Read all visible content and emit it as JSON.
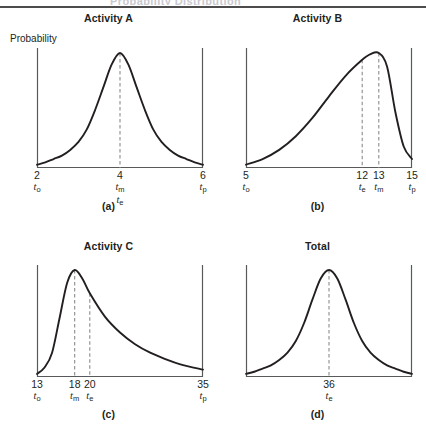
{
  "figure": {
    "top_fragment": "Probability Distribution",
    "y_axis_label": "Probability"
  },
  "panels": [
    {
      "id": "panel-a",
      "title": "Activity A",
      "caption": "(a)",
      "show_ylabel": true,
      "ticks": [
        {
          "pos": 0.0,
          "num": "2",
          "sym": "t",
          "sub": "o",
          "sym2": null,
          "sub2": null
        },
        {
          "pos": 0.5,
          "num": "4",
          "sym": "t",
          "sub": "m",
          "sym2": "t",
          "sub2": "e"
        },
        {
          "pos": 1.0,
          "num": "6",
          "sym": "t",
          "sub": "p",
          "sym2": null,
          "sub2": null
        }
      ],
      "dashed": [
        0.5
      ],
      "chart_data": {
        "type": "line",
        "title": "Activity A",
        "xlabel": "",
        "ylabel": "Probability",
        "xlim": [
          2,
          6
        ],
        "ylim": [
          0,
          1
        ],
        "grid": false,
        "legend": "none",
        "annotations": [
          "t_o = 2",
          "t_m = 4",
          "t_e = 4",
          "t_p = 6"
        ],
        "x": [
          2.0,
          2.2,
          2.4,
          2.6,
          2.8,
          3.0,
          3.2,
          3.4,
          3.6,
          3.8,
          4.0,
          4.2,
          4.4,
          4.6,
          4.8,
          5.0,
          5.2,
          5.4,
          5.6,
          5.8,
          6.0
        ],
        "y": [
          0.02,
          0.04,
          0.07,
          0.1,
          0.15,
          0.22,
          0.33,
          0.5,
          0.7,
          0.9,
          1.0,
          0.9,
          0.7,
          0.5,
          0.33,
          0.22,
          0.15,
          0.1,
          0.07,
          0.04,
          0.02
        ]
      }
    },
    {
      "id": "panel-b",
      "title": "Activity B",
      "caption": "(b)",
      "show_ylabel": false,
      "ticks": [
        {
          "pos": 0.0,
          "num": "5",
          "sym": "t",
          "sub": "o",
          "sym2": null,
          "sub2": null
        },
        {
          "pos": 0.7,
          "num": "12",
          "sym": "t",
          "sub": "e",
          "sym2": null,
          "sub2": null
        },
        {
          "pos": 0.8,
          "num": "13",
          "sym": "t",
          "sub": "m",
          "sym2": null,
          "sub2": null
        },
        {
          "pos": 1.0,
          "num": "15",
          "sym": "t",
          "sub": "p",
          "sym2": null,
          "sub2": null
        }
      ],
      "dashed": [
        0.7,
        0.8
      ],
      "chart_data": {
        "type": "line",
        "title": "Activity B",
        "xlabel": "",
        "ylabel": "Probability",
        "xlim": [
          5,
          15
        ],
        "ylim": [
          0,
          1
        ],
        "grid": false,
        "legend": "none",
        "annotations": [
          "t_o = 5",
          "t_e = 12",
          "t_m = 13",
          "t_p = 15"
        ],
        "x": [
          5,
          6,
          7,
          8,
          9,
          10,
          11,
          12,
          12.5,
          13,
          13.5,
          14,
          14.5,
          15
        ],
        "y": [
          0.02,
          0.07,
          0.15,
          0.27,
          0.43,
          0.62,
          0.8,
          0.94,
          0.99,
          1.0,
          0.88,
          0.48,
          0.18,
          0.07
        ]
      }
    },
    {
      "id": "panel-c",
      "title": "Activity C",
      "caption": "(c)",
      "show_ylabel": false,
      "ticks": [
        {
          "pos": 0.0,
          "num": "13",
          "sym": "t",
          "sub": "o",
          "sym2": null,
          "sub2": null
        },
        {
          "pos": 0.227,
          "num": "18",
          "sym": "t",
          "sub": "m",
          "sym2": null,
          "sub2": null
        },
        {
          "pos": 0.318,
          "num": "20",
          "sym": "t",
          "sub": "e",
          "sym2": null,
          "sub2": null
        },
        {
          "pos": 1.0,
          "num": "35",
          "sym": "t",
          "sub": "p",
          "sym2": null,
          "sub2": null
        }
      ],
      "dashed": [
        0.227,
        0.318
      ],
      "chart_data": {
        "type": "line",
        "title": "Activity C",
        "xlabel": "",
        "ylabel": "Probability",
        "xlim": [
          13,
          35
        ],
        "ylim": [
          0,
          1
        ],
        "grid": false,
        "legend": "none",
        "annotations": [
          "t_o = 13",
          "t_m = 18",
          "t_e = 20",
          "t_p = 35"
        ],
        "x": [
          13,
          14,
          15,
          16,
          17,
          18,
          19,
          20,
          22,
          24,
          26,
          28,
          30,
          32,
          35
        ],
        "y": [
          0.02,
          0.08,
          0.22,
          0.55,
          0.88,
          1.0,
          0.92,
          0.78,
          0.56,
          0.41,
          0.3,
          0.22,
          0.16,
          0.11,
          0.06
        ]
      }
    },
    {
      "id": "panel-d",
      "title": "Total",
      "caption": "(d)",
      "show_ylabel": false,
      "ticks": [
        {
          "pos": 0.5,
          "num": "36",
          "sym": "t",
          "sub": "e",
          "sym2": null,
          "sub2": null
        }
      ],
      "dashed": [
        0.5
      ],
      "chart_data": {
        "type": "line",
        "title": "Total",
        "xlabel": "",
        "ylabel": "Probability",
        "xlim": [
          0,
          1
        ],
        "ylim": [
          0,
          1
        ],
        "grid": false,
        "legend": "none",
        "annotations": [
          "t_e = 36"
        ],
        "x": [
          0.0,
          0.05,
          0.1,
          0.15,
          0.2,
          0.25,
          0.3,
          0.35,
          0.4,
          0.45,
          0.5,
          0.55,
          0.6,
          0.65,
          0.7,
          0.75,
          0.8,
          0.85,
          0.9,
          0.95,
          1.0
        ],
        "y": [
          0.02,
          0.04,
          0.07,
          0.1,
          0.15,
          0.22,
          0.33,
          0.5,
          0.72,
          0.92,
          1.0,
          0.92,
          0.72,
          0.5,
          0.33,
          0.22,
          0.15,
          0.1,
          0.07,
          0.04,
          0.02
        ]
      }
    }
  ],
  "colors": {
    "curve": "#231f20",
    "axis": "#58595b",
    "dashed": "#8c8c8c",
    "text": "#231f20",
    "background": "#ffffff"
  }
}
